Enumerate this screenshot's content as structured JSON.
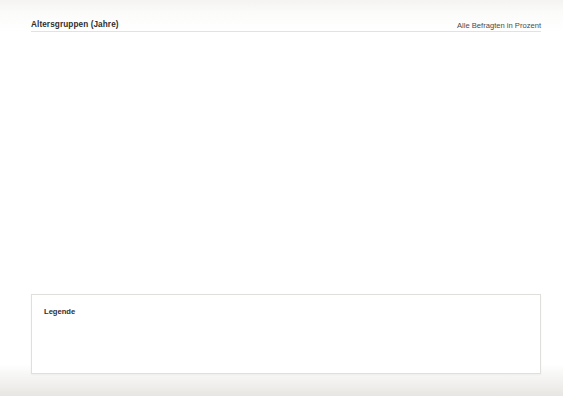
{
  "header": {
    "title": "Altersgruppen (Jahre)",
    "note": "Alle Befragten in Prozent"
  },
  "legend": {
    "title": "Legende",
    "age_column_header": "Altersgruppe",
    "columns": [
      "Hohe Zustimmung",
      "Unentschieden",
      "Keine Zustimmung"
    ],
    "age_groups": [
      "16–29",
      "30–49",
      "50–64"
    ],
    "colors": {
      "green_dark": "#4a9c45",
      "green_mid": "#7dbb6e",
      "green_light": "#aed89b",
      "orange_dark": "#f08a36",
      "orange_mid": "#f8b36a",
      "orange_light": "#fbd8a4",
      "blue_dark": "#2c72ad",
      "blue_mid": "#6ba3d4",
      "blue_light": "#c3e0f2"
    }
  },
  "items": [
    {
      "num": "1.",
      "text": "„Situationen, wie sie in dem Beitrag gezeigt werden, gibt es fast jeden Tag an allen deutschen Schulen.“"
    },
    {
      "num": "2.",
      "text": "„Man weiß doch, dass solche Schulermittler sinnvoll sind – es sollte mehr davon geben.“"
    },
    {
      "num": "3.",
      "text": "„Ich finde, die Schulermittler im Filmausschnitt verhalten sich glaubwürdig.“"
    },
    {
      "num": "4.",
      "text": "„Die gezeigte Handlung ist echt, wurde nicht für die Kamera gespielt.“"
    },
    {
      "num": "5.",
      "text": "„Ich sehe gerne Beiträge dieser Art.“"
    }
  ],
  "chart_data": {
    "type": "bar",
    "title": "Altersgruppen (Jahre)",
    "subtitle": "Alle Befragten in Prozent",
    "orientation": "horizontal",
    "stacked": true,
    "unit": "percent",
    "xlabel": "",
    "ylabel": "",
    "xlim": [
      0,
      145
    ],
    "grid": false,
    "legend_position": "bottom",
    "categories": [
      "„Situationen, wie sie in dem Beitrag gezeigt werden, gibt es fast jeden Tag an allen deutschen Schulen.“",
      "„Man weiß doch, dass solche Schulermittler sinnvoll sind – es sollte mehr davon geben.“",
      "„Ich finde, die Schulermittler im Filmausschnitt verhalten sich glaubwürdig.“",
      "„Die gezeigte Handlung ist echt, wurde nicht für die Kamera gespielt.“",
      "„Ich sehe gerne Beiträge dieser Art.“"
    ],
    "age_groups": [
      "16–29",
      "30–49",
      "50–64"
    ],
    "responses": [
      "Hohe Zustimmung",
      "Unentschieden",
      "Keine Zustimmung"
    ],
    "values": [
      {
        "16-29": [
          41,
          50,
          53
        ],
        "30-49": [
          49,
          44,
          40
        ],
        "50-64": [
          8,
          6,
          7
        ]
      },
      {
        "16-29": [
          42,
          48,
          52
        ],
        "30-49": [
          48,
          43,
          35
        ],
        "50-64": [
          10,
          9,
          13
        ]
      },
      {
        "16-29": [
          30,
          33,
          42
        ],
        "30-49": [
          50,
          50,
          42
        ],
        "50-64": [
          20,
          17,
          16
        ]
      },
      {
        "16-29": [
          12,
          17,
          17
        ],
        "30-49": [
          38,
          38,
          43
        ],
        "50-64": [
          50,
          45,
          40
        ]
      },
      {
        "16-29": [
          20,
          25,
          21
        ],
        "30-49": [
          48,
          41,
          44
        ],
        "50-64": [
          32,
          34,
          35
        ]
      }
    ]
  }
}
